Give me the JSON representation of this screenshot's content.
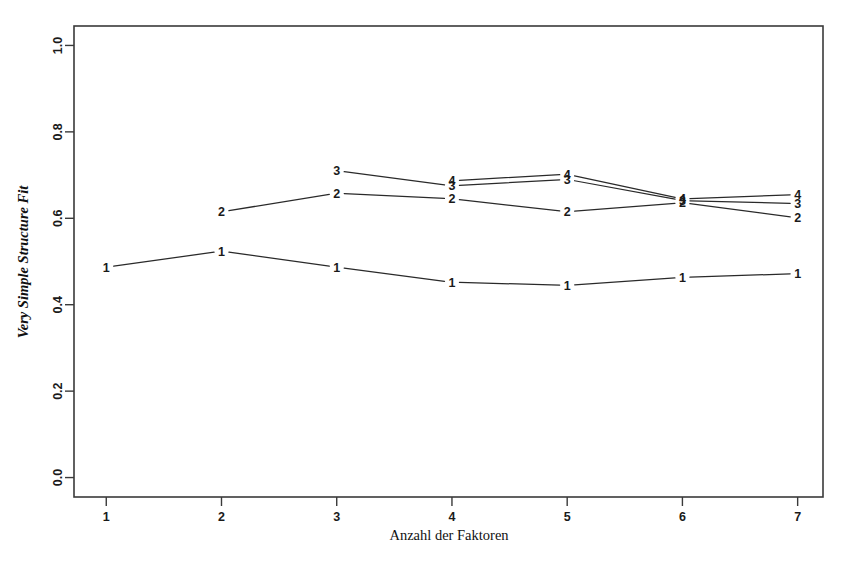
{
  "chart_data": {
    "type": "line",
    "title": "",
    "xlabel": "Anzahl der Faktoren",
    "ylabel": "Very Simple Structure Fit",
    "x": [
      1,
      2,
      3,
      4,
      5,
      6,
      7
    ],
    "xticklabels": [
      "1",
      "2",
      "3",
      "4",
      "5",
      "6",
      "7"
    ],
    "yticklabels": [
      "0.0",
      "0.2",
      "0.4",
      "0.6",
      "0.8",
      "1.0"
    ],
    "yticks": [
      0.0,
      0.2,
      0.4,
      0.6,
      0.8,
      1.0
    ],
    "xlim": [
      0.72,
      7.22
    ],
    "ylim": [
      -0.045,
      1.045
    ],
    "grid": false,
    "legend": "none",
    "point_markers": "series-number-digits",
    "series": [
      {
        "name": "1",
        "label": "1",
        "x": [
          1,
          2,
          3,
          4,
          5,
          6,
          7
        ],
        "values": [
          0.487,
          0.524,
          0.487,
          0.452,
          0.445,
          0.463,
          0.472
        ]
      },
      {
        "name": "2",
        "label": "2",
        "x": [
          2,
          3,
          4,
          5,
          6,
          7
        ],
        "values": [
          0.615,
          0.658,
          0.645,
          0.615,
          0.636,
          0.601
        ]
      },
      {
        "name": "3",
        "label": "3",
        "x": [
          3,
          4,
          5,
          6,
          7
        ],
        "values": [
          0.71,
          0.675,
          0.69,
          0.641,
          0.634
        ]
      },
      {
        "name": "4",
        "label": "4",
        "x": [
          4,
          5,
          6,
          7
        ],
        "values": [
          0.687,
          0.702,
          0.645,
          0.655
        ]
      }
    ]
  },
  "axes": {
    "y_axis_title": "Very Simple Structure Fit",
    "x_axis_title": "Anzahl der Faktoren"
  },
  "colors": {
    "background": "#ffffff",
    "axis": "#3a3a3a",
    "line": "#2a2a2a",
    "text": "#111111"
  }
}
